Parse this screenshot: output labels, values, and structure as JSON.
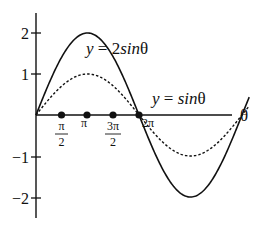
{
  "chart_data": {
    "type": "line",
    "title": "",
    "xlabel": "θ",
    "ylabel": "",
    "xlim": [
      0,
      6.2832
    ],
    "ylim": [
      -2,
      2
    ],
    "grid": false,
    "legend_position": "inline annotations",
    "x_ticks": [
      {
        "value": 1.5708,
        "label_num": "π",
        "label_den": "2"
      },
      {
        "value": 3.1416,
        "label": "π"
      },
      {
        "value": 4.7124,
        "label_num": "3π",
        "label_den": "2"
      },
      {
        "value": 6.2832,
        "label": "2π"
      }
    ],
    "y_ticks": [
      {
        "value": 2,
        "label": "2"
      },
      {
        "value": 1,
        "label": "1"
      },
      {
        "value": -1,
        "label": "−1"
      },
      {
        "value": -2,
        "label": "−2"
      }
    ],
    "series": [
      {
        "name": "y = 2sinθ",
        "style": "solid",
        "amplitude": 2,
        "x": [
          0,
          1.5708,
          3.1416,
          4.7124,
          6.2832
        ],
        "values": [
          0,
          2,
          0,
          -2,
          0
        ]
      },
      {
        "name": "y = sinθ",
        "style": "dashed",
        "amplitude": 1,
        "x": [
          0,
          1.5708,
          3.1416,
          4.7124,
          6.2832
        ],
        "values": [
          0,
          1,
          0,
          -1,
          0
        ]
      }
    ],
    "markers": [
      {
        "x": 1.5708,
        "y": 0
      },
      {
        "x": 3.1416,
        "y": 0
      },
      {
        "x": 4.7124,
        "y": 0
      },
      {
        "x": 6.2832,
        "y": 0
      }
    ],
    "annotations": [
      {
        "text_prefix": "y = 2",
        "text_italic": "sin",
        "text_suffix": "θ",
        "series": "y = 2sinθ"
      },
      {
        "text_prefix": "y = ",
        "text_italic": "sin",
        "text_suffix": "θ",
        "series": "y = sinθ"
      }
    ]
  },
  "labels": {
    "x_axis": "θ",
    "y2": "2",
    "y1": "1",
    "ym1": "−1",
    "ym2": "−2",
    "pi_half_num": "π",
    "pi_half_den": "2",
    "pi": "π",
    "three_pi_half_num": "3π",
    "three_pi_half_den": "2",
    "two_pi": "2π",
    "ann_2sin_y": "y",
    "ann_2sin_eq": " = 2",
    "ann_2sin_sin": "sin",
    "ann_2sin_theta": "θ",
    "ann_sin_y": "y",
    "ann_sin_eq": " = ",
    "ann_sin_sin": "sin",
    "ann_sin_theta": "θ"
  }
}
